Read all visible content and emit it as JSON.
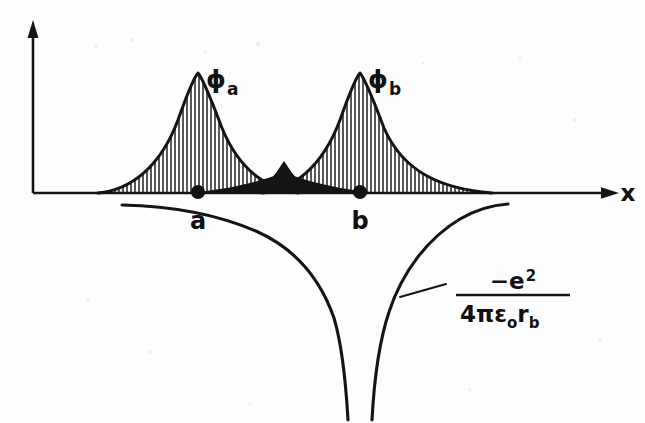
{
  "figure": {
    "kind": "scientific-diagram",
    "background_color": "#fdfdfd",
    "ink_color": "#141414"
  },
  "axes": {
    "x_axis_label": "x",
    "y_axis_label": "",
    "x_axis_arrow": "arrow-right",
    "y_axis_arrow": "arrow-up",
    "origin_px": [
      33,
      193
    ],
    "x_axis_end_px": [
      618,
      193
    ],
    "y_axis_top_px": [
      33,
      23
    ]
  },
  "orbitals": [
    {
      "name": "phi-a",
      "symbol": "ϕ",
      "subscript": "a",
      "label_px": [
        214,
        82
      ],
      "apex_px": [
        198,
        73
      ],
      "left_edge_px": 98,
      "right_edge_px": 298,
      "baseline_px": 193,
      "hatch": "vertical",
      "hatch_spacing_px": 4.2
    },
    {
      "name": "phi-b",
      "symbol": "ϕ",
      "subscript": "b",
      "label_px": [
        376,
        82
      ],
      "apex_px": [
        360,
        73
      ],
      "left_edge_px": 262,
      "right_edge_px": 492,
      "baseline_px": 193,
      "hatch": "vertical",
      "hatch_spacing_px": 4.2
    }
  ],
  "nuclei": [
    {
      "name": "nucleus-a",
      "label": "a",
      "x_px": 198,
      "y_px": 193,
      "label_px": [
        192,
        222
      ],
      "radius_px": 6.5
    },
    {
      "name": "nucleus-b",
      "label": "b",
      "x_px": 360,
      "y_px": 193,
      "label_px": [
        354,
        222
      ],
      "radius_px": 6.5
    }
  ],
  "overlap_region": {
    "name": "overlap-lens",
    "fill_color": "#141414",
    "left_px": 175,
    "right_px": 385,
    "peak_height_px": 17,
    "baseline_px": 193
  },
  "coulomb": {
    "curve_name": "coulomb-potential-well",
    "left_branch_start_px": [
      122,
      205
    ],
    "left_branch_end_px": [
      348,
      420
    ],
    "right_branch_start_px": [
      372,
      420
    ],
    "right_branch_end_px": [
      508,
      204
    ],
    "asymptote_x_px": 360,
    "leader_line_from_px": [
      398,
      296
    ],
    "leader_line_to_px": [
      444,
      283
    ]
  },
  "formula": {
    "name": "coulomb-formula",
    "numerator": "−e",
    "numerator_superscript": "2",
    "denominator_lead": "4πε",
    "denominator_sub_1": "o",
    "denominator_tail": "r",
    "denominator_sub_2": "b",
    "plain_text": "-e^2 / (4πεₒr_b)",
    "fraction_bar_px": [
      458,
      294,
      568,
      294
    ],
    "numerator_px": [
      496,
      287
    ],
    "denominator_px": [
      462,
      320
    ]
  }
}
